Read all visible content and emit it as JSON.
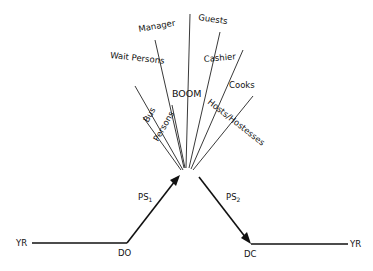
{
  "diagram": {
    "center_label": "BOOM",
    "stakeholders": [
      {
        "label": "Manager"
      },
      {
        "label": "Guests"
      },
      {
        "label": "Wait Persons"
      },
      {
        "label": "Cashier"
      },
      {
        "label": "Cooks"
      },
      {
        "label": "Bus"
      },
      {
        "label": "Persons"
      },
      {
        "label": "Hosts/Hostesses"
      }
    ],
    "timeline": {
      "start_label": "YR",
      "end_label": "YR",
      "door_open": "DO",
      "door_close": "DC",
      "phase1": {
        "main": "PS",
        "sub": "1"
      },
      "phase2": {
        "main": "PS",
        "sub": "2"
      }
    }
  }
}
